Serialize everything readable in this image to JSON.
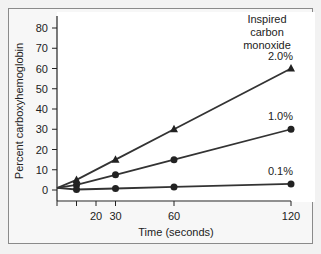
{
  "chart_data": {
    "type": "line",
    "title": "",
    "xlabel": "Time (seconds)",
    "ylabel": "Percent carboxyhemoglobin",
    "xlim": [
      0,
      120
    ],
    "ylim": [
      -5,
      85
    ],
    "grid": false,
    "x_ticks": [
      0,
      10,
      20,
      30,
      60,
      120
    ],
    "x_tick_labels": [
      "",
      "",
      "20",
      "30",
      "60",
      "120"
    ],
    "y_ticks": [
      0,
      10,
      20,
      30,
      40,
      50,
      60,
      70,
      80
    ],
    "y_tick_labels": [
      "0",
      "10",
      "20",
      "30",
      "40",
      "50",
      "60",
      "70",
      "80"
    ],
    "legend_title": "Inspired carbon monoxide",
    "legend_title_lines": [
      "Inspired",
      "carbon",
      "monoxide"
    ],
    "x": [
      0,
      10,
      30,
      60,
      120
    ],
    "series": [
      {
        "name": "2.0%",
        "marker": "triangle",
        "values": [
          1,
          5,
          15,
          30,
          60
        ]
      },
      {
        "name": "1.0%",
        "marker": "circle",
        "values": [
          1,
          2.5,
          7.5,
          15,
          30
        ]
      },
      {
        "name": "0.1%",
        "marker": "circle",
        "values": [
          1,
          0.25,
          0.75,
          1.5,
          3
        ]
      }
    ],
    "colors": {
      "line": "#333333",
      "marker": "#222222",
      "axis": "#222222",
      "panel_border": "#8a8a8a"
    }
  }
}
